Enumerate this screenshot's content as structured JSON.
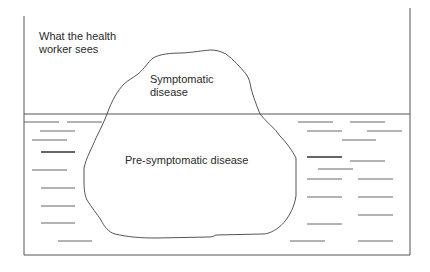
{
  "diagram": {
    "type": "iceberg",
    "labels": {
      "visible_region_line1": "What the health",
      "visible_region_line2": "worker sees",
      "tip_line1": "Symptomatic",
      "tip_line2": "disease",
      "submerged": "Pre-symptomatic disease"
    },
    "colors": {
      "line": "#555555",
      "text": "#2a2a2a",
      "background": "#ffffff"
    }
  }
}
